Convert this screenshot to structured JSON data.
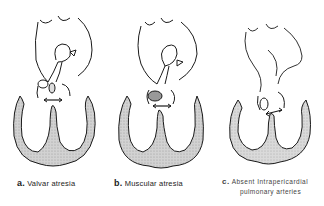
{
  "figures": [
    {
      "letter": "a.",
      "label": "Valvar atresia"
    },
    {
      "letter": "b.",
      "label": "Muscular atresia"
    },
    {
      "letter": "c.",
      "label": "Absent Intrapericardial",
      "label_line2": "pulmonary arteries"
    }
  ],
  "colors": {
    "myocardium_fill": "#c9c9c9",
    "line": "#1a1a1a",
    "background": "#ffffff"
  }
}
